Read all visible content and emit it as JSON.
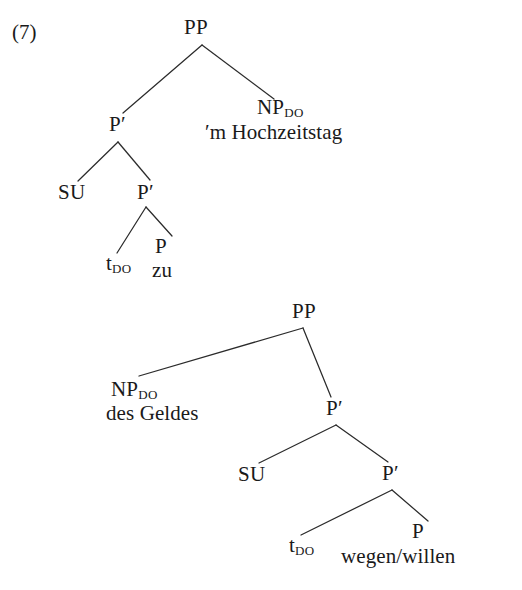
{
  "figure": {
    "example_number": "(7)",
    "ink_color": "#2b2b2b",
    "background_color": "#ffffff"
  },
  "tree_one": {
    "name": "zu-construction",
    "nodes": {
      "root": "PP",
      "pbar_upper": "P′",
      "np_do_label": "NP",
      "np_do_sub": "DO",
      "np_do_word": "′m Hochzeitstag",
      "su": "SU",
      "pbar_lower": "P′",
      "trace_label": "t",
      "trace_sub": "DO",
      "p_head": "P",
      "p_head_word": "zu"
    }
  },
  "tree_two": {
    "name": "wegen-willen-construction",
    "nodes": {
      "root": "PP",
      "np_do_label": "NP",
      "np_do_sub": "DO",
      "np_do_word": "des Geldes",
      "pbar_upper": "P′",
      "su": "SU",
      "pbar_lower": "P′",
      "trace_label": "t",
      "trace_sub": "DO",
      "p_head": "P",
      "p_head_word": "wegen/willen"
    }
  }
}
